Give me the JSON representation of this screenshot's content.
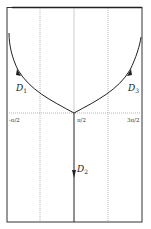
{
  "diagram": {
    "type": "phase-trajectories",
    "frame": {
      "left": 7,
      "top": 7,
      "right": 142,
      "bottom": 222
    },
    "axis": {
      "horizontal_y": 105,
      "tick_labels": [
        {
          "text": "-π/2",
          "x": 10
        },
        {
          "text": "π/2",
          "x": 77
        },
        {
          "text": "3π/2",
          "x": 129
        }
      ]
    },
    "grid": {
      "dotted_verticals_x": [
        40,
        108
      ],
      "center_line_x": 74
    },
    "curves": [
      {
        "name": "D",
        "sub": "1",
        "label_x": 16,
        "label_y": 93,
        "direction": "up-left"
      },
      {
        "name": "D",
        "sub": "2",
        "label_x": 78,
        "label_y": 170,
        "direction": "down"
      },
      {
        "name": "D",
        "sub": "3",
        "label_x": 128,
        "label_y": 92,
        "direction": "up-right"
      }
    ],
    "colors": {
      "line": "#222222",
      "grid": "#9a9a9a",
      "frame": "#333333"
    }
  }
}
